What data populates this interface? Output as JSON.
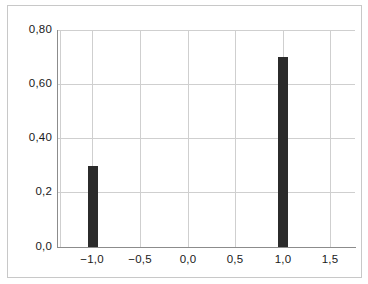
{
  "chart_data": {
    "type": "bar",
    "title": "",
    "subtitle": "",
    "xlabel": "",
    "ylabel": "",
    "categories": [
      "-1,0",
      "1,0"
    ],
    "x": [
      -1.0,
      1.0
    ],
    "values": [
      0.3,
      0.7
    ],
    "series": [
      {
        "name": "",
        "values": [
          0.3,
          0.7
        ]
      }
    ],
    "xlim": [
      -1.75,
      1.75
    ],
    "ylim": [
      0.0,
      0.8
    ],
    "grid": true,
    "legend": false,
    "legend_position": "none",
    "bar_color": "#2b2b2b",
    "grid_color": "#cfcfcf",
    "axis_color": "#8c8c8c",
    "frame_color": "#c8c8c8",
    "background": "#ffffff",
    "decimal_separator": ",",
    "y_ticks": [
      {
        "value": 0.8,
        "label": "0,80"
      },
      {
        "value": 0.6,
        "label": "0,60"
      },
      {
        "value": 0.4,
        "label": "0,40"
      },
      {
        "value": 0.2,
        "label": "0,2"
      },
      {
        "value": 0.0,
        "label": "0,0"
      }
    ],
    "x_ticks": [
      {
        "value": -1.5,
        "label": ""
      },
      {
        "value": -1.0,
        "label": "−1,0"
      },
      {
        "value": -0.5,
        "label": "−0,5"
      },
      {
        "value": 0.0,
        "label": "0,0"
      },
      {
        "value": 0.5,
        "label": "0,5"
      },
      {
        "value": 1.0,
        "label": "1,0"
      },
      {
        "value": 1.5,
        "label": "1,5"
      }
    ],
    "annotations": []
  }
}
